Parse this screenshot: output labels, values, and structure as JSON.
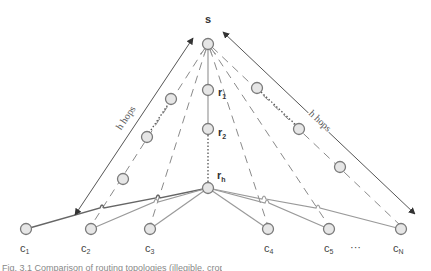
{
  "diagram": {
    "source_label": "s",
    "relay_labels": {
      "r1": "r",
      "r1_sub": "1",
      "r2": "r",
      "r2_sub": "2",
      "rh": "r",
      "rh_sub": "h"
    },
    "client_labels": [
      {
        "main": "c",
        "sub": "1"
      },
      {
        "main": "c",
        "sub": "2"
      },
      {
        "main": "c",
        "sub": "3"
      },
      {
        "main": "c",
        "sub": "4"
      },
      {
        "main": "c",
        "sub": "5"
      },
      {
        "main": "c",
        "sub": "N"
      }
    ],
    "ellipsis": "···",
    "left_span_label": "h hops",
    "right_span_label": "h hops",
    "colors": {
      "node_fill": "#e6e6e6",
      "node_stroke": "#7a7a7a",
      "line": "#9a9a9a"
    }
  },
  "caption": "Fig. 3.1 Comparison of routing topologies (illegible, cropped)"
}
